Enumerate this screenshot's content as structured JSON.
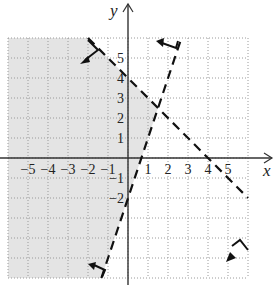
{
  "chart_data": {
    "type": "line",
    "title": "",
    "xlabel": "x",
    "ylabel": "y",
    "xlim": [
      -6,
      6
    ],
    "ylim": [
      -6,
      6
    ],
    "grid": true,
    "grid_style": "dotted",
    "x_ticks": [
      "-5",
      "-4",
      "-3",
      "-2",
      "-1",
      "1",
      "2",
      "3",
      "4",
      "5"
    ],
    "y_ticks": [
      "5",
      "4",
      "3",
      "2",
      "1",
      "-1",
      "-2"
    ],
    "series": [
      {
        "name": "boundary-1",
        "equation": "x + y = 4",
        "style": "dashed",
        "points": [
          [
            -2,
            6
          ],
          [
            6,
            -2
          ]
        ],
        "y_intercept": 4,
        "x_intercept": 4,
        "shade_side": "below-left"
      },
      {
        "name": "boundary-2",
        "equation": "y = 3x - 2",
        "style": "dashed",
        "points": [
          [
            -1.33,
            -6
          ],
          [
            2.67,
            6
          ]
        ],
        "y_intercept": -2,
        "x_intercept": 0.67,
        "shade_side": "left"
      }
    ],
    "shaded_region": "x + y < 4 and y > 3x - 2",
    "shade_color": "#e4e4e4",
    "intersection": [
      1.5,
      2.5
    ]
  },
  "labels": {
    "x_axis": "x",
    "y_axis": "y"
  }
}
